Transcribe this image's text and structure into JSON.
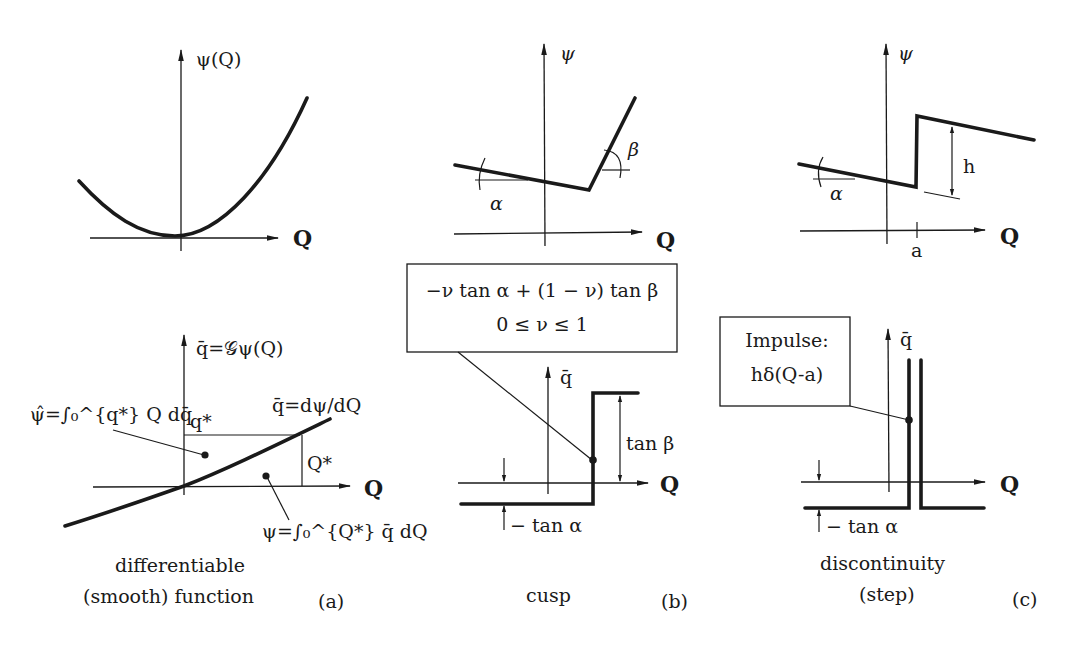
{
  "figure": {
    "panels": [
      {
        "id": "a",
        "caption_line1": "differentiable",
        "caption_line2": "(smooth) function",
        "tag": "(a)",
        "top_graph": {
          "y_label": "ψ(Q)",
          "x_label": "Q",
          "curve": "convex parabola-like smooth curve, minimum near origin"
        },
        "bottom_graph": {
          "y_label": "q̄=𝒢ψ(Q)",
          "x_label": "Q",
          "curve_label": "q̄=dψ/dQ",
          "q_star_label": "q*",
          "Q_star_label": "Q*",
          "conjugate_area_label": "ψ̂=∫₀^{q*} Q dq̄",
          "primal_area_label": "ψ=∫₀^{Q*} q̄ dQ"
        }
      },
      {
        "id": "b",
        "caption": "cusp",
        "tag": "(b)",
        "top_graph": {
          "y_label": "ψ",
          "x_label": "Q",
          "angle_left": "α",
          "angle_right": "β"
        },
        "callout": {
          "line1": "−ν tan α + (1 − ν) tan β",
          "line2": "0 ≤ ν ≤ 1"
        },
        "bottom_graph": {
          "y_label": "q̄",
          "x_label": "Q",
          "upper_jump_label": "tan β",
          "lower_offset_label": "− tan α"
        }
      },
      {
        "id": "c",
        "caption_line1": "discontinuity",
        "caption_line2": "(step)",
        "tag": "(c)",
        "top_graph": {
          "y_label": "ψ",
          "x_label": "Q",
          "angle_left": "α",
          "jump_label": "h",
          "jump_location_label": "a"
        },
        "callout": {
          "line1": "Impulse:",
          "line2": "hδ(Q-a)"
        },
        "bottom_graph": {
          "y_label": "q̄",
          "x_label": "Q",
          "lower_offset_label": "− tan α"
        }
      }
    ]
  },
  "colors": {
    "ink": "#1a1a1a",
    "background": "#ffffff"
  }
}
